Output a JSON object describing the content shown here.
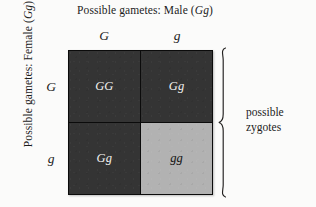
{
  "figure": {
    "type": "punnett-square",
    "top_axis_title": {
      "prefix": "Possible gametes: Male (",
      "alleles": "Gg",
      "suffix": ")"
    },
    "left_axis_title": {
      "prefix": "Possible gametes: Female (",
      "alleles": "Gg",
      "suffix": ")"
    },
    "column_headers": [
      "G",
      "g"
    ],
    "row_headers": [
      "G",
      "g"
    ],
    "cells": [
      {
        "genotype": "GG",
        "row": 0,
        "col": 0,
        "style": "dark"
      },
      {
        "genotype": "Gg",
        "row": 0,
        "col": 1,
        "style": "dark"
      },
      {
        "genotype": "Gg",
        "row": 1,
        "col": 0,
        "style": "dark"
      },
      {
        "genotype": "gg",
        "row": 1,
        "col": 1,
        "style": "light"
      }
    ],
    "brace_label": {
      "line1": "possible",
      "line2": "zygotes"
    },
    "colors": {
      "background": "#fbfbfa",
      "dark_cell": "#343434",
      "dark_cell_text": "#f2f2f0",
      "light_cell": "#b2b2b2",
      "light_cell_text": "#131313",
      "grid_line": "#0b0b0b",
      "text": "#1c1c1c"
    }
  }
}
